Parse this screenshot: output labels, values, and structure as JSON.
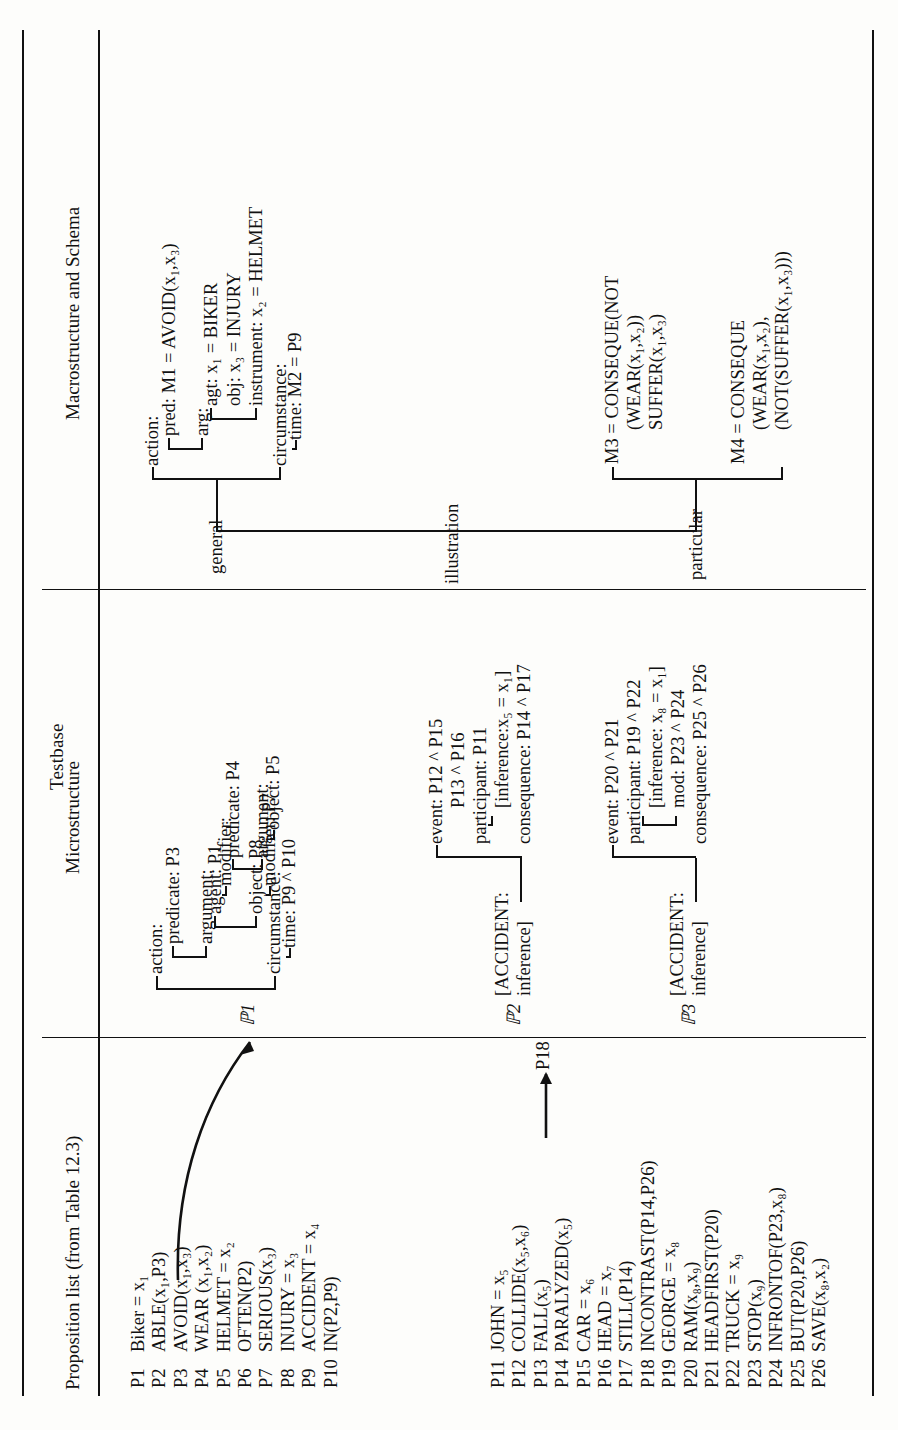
{
  "figure": {
    "caption": "Testbase",
    "columns": [
      {
        "id": "proposition_list",
        "header": "Proposition list (from Table 12.3)"
      },
      {
        "id": "microstructure",
        "header": "Microstructure"
      },
      {
        "id": "macrostructure",
        "header": "Macrostructure and Schema"
      }
    ]
  },
  "proposition_list": {
    "block1": [
      {
        "id": "P1",
        "text": "Biker  =  x₁"
      },
      {
        "id": "P2",
        "text": "ABLE(x₁,P3)"
      },
      {
        "id": "P3",
        "text": "AVOID(x₁,x₃)"
      },
      {
        "id": "P4",
        "text": "WEAR (x₁,x₂)"
      },
      {
        "id": "P5",
        "text": "HELMET  =  x₂"
      },
      {
        "id": "P6",
        "text": "OFTEN(P2)"
      },
      {
        "id": "P7",
        "text": "SERIOUS(x₃)"
      },
      {
        "id": "P8",
        "text": "INJURY  =  x₃"
      },
      {
        "id": "P9",
        "text": "ACCIDENT  =  x₄"
      },
      {
        "id": "P10",
        "text": "IN(P2,P9)"
      }
    ],
    "block2": [
      {
        "id": "P11",
        "text": "JOHN  =  x₅"
      },
      {
        "id": "P12",
        "text": "COLLIDE(x₅,x₆)"
      },
      {
        "id": "P13",
        "text": "FALL(x₅)"
      },
      {
        "id": "P14",
        "text": "PARALYZED(x₅)"
      },
      {
        "id": "P15",
        "text": "CAR  =  x₆"
      },
      {
        "id": "P16",
        "text": "HEAD  =  x₇"
      },
      {
        "id": "P17",
        "text": "STILL(P14)"
      },
      {
        "id": "P18",
        "text": "INCONTRAST(P14,P26)"
      },
      {
        "id": "P19",
        "text": "GEORGE  =  x₈"
      },
      {
        "id": "P20",
        "text": "RAM(x₈,x₉)"
      },
      {
        "id": "P21",
        "text": "HEADFIRST(P20)"
      },
      {
        "id": "P22",
        "text": "TRUCK  =  x₉"
      },
      {
        "id": "P23",
        "text": "STOP(x₉)"
      },
      {
        "id": "P24",
        "text": "INFRONTOF(P23,x₈)"
      },
      {
        "id": "P25",
        "text": "BUT(P20,P26)"
      },
      {
        "id": "P26",
        "text": "SAVE(x₈,x₂)"
      }
    ]
  },
  "microstructure": {
    "p1_tree": {
      "root_label": "ℙ︎1",
      "nodes": [
        {
          "label": "action:"
        },
        {
          "label": "predicate:  P3"
        },
        {
          "label": "argument:"
        },
        {
          "label": "agent:  P1"
        },
        {
          "label": "modifier:"
        },
        {
          "label": "predicate:  P4"
        },
        {
          "label": "argument:"
        },
        {
          "label": "object:  P5"
        },
        {
          "label": "object:  P8"
        },
        {
          "label": "modifier:  P7"
        },
        {
          "label": "circumstance:"
        },
        {
          "label": "time:  P9 ^ P10"
        }
      ]
    },
    "p2_tree": {
      "root_label": "ℙ︎2",
      "head": "[ACCIDENT:",
      "head2": "inference]",
      "nodes": [
        {
          "label": "event:  P12 ^ P15"
        },
        {
          "label": "P13 ^ P16"
        },
        {
          "label": "participant: P11"
        },
        {
          "label": "[inference:x₅  =  x₁]"
        },
        {
          "label": "consequence:  P14 ^ P17"
        }
      ],
      "link_node": "P18"
    },
    "p3_tree": {
      "root_label": "ℙ︎3",
      "head": "[ACCIDENT:",
      "head2": "inference]",
      "nodes": [
        {
          "label": "event:  P20 ^ P21"
        },
        {
          "label": "participant: P19 ^ P22"
        },
        {
          "label": "[inference:  x₈  =  x₁]"
        },
        {
          "label": "mod:  P23 ^ P24"
        },
        {
          "label": "consequence:  P25 ^ P26"
        }
      ]
    }
  },
  "macrostructure": {
    "branches": [
      {
        "label": "general"
      },
      {
        "label": "illustration"
      },
      {
        "label": "particular"
      }
    ],
    "general_tree": {
      "nodes": [
        {
          "label": "action:"
        },
        {
          "label": "pred:  M1  =  AVOID(x₁,x₃)"
        },
        {
          "label": "arg:"
        },
        {
          "label": "agt:  x₁  =  BIKER"
        },
        {
          "label": "obj:  x₃  =  INJURY"
        },
        {
          "label": "instrument:  x₂  =  HELMET"
        },
        {
          "label": "circumstance:"
        },
        {
          "label": "time:  M2  =  P9"
        }
      ]
    },
    "particular_tree": {
      "m3": [
        {
          "label": "M3  =  CONSEQUE(NOT"
        },
        {
          "label": "(WEAR(x₁,x₂))"
        },
        {
          "label": "SUFFER(x₁,x₃)"
        }
      ],
      "m4": [
        {
          "label": "M4  =  CONSEQUE"
        },
        {
          "label": "(WEAR(x₁,x₂),"
        },
        {
          "label": "(NOT(SUFFER(x₁,x₃)))"
        }
      ]
    }
  }
}
